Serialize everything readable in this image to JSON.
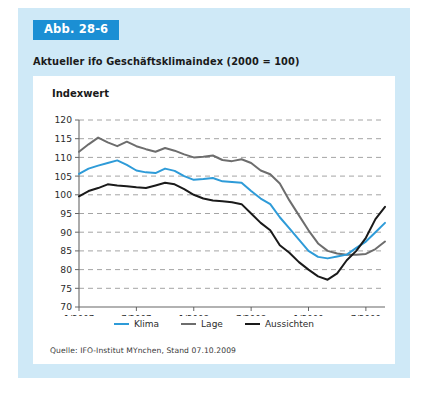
{
  "figure": {
    "badge_label": "Abb. 28-6",
    "title": "Aktueller ifo Geschäftsklimaindex (2000 = 100)",
    "source": "Quelle: IFO-Institut MYnchen, Stand 07.10.2009",
    "panel_color": "#cfe9f7",
    "badge_color": "#1b8fd4",
    "card_color": "#ffffff"
  },
  "chart_data": {
    "type": "line",
    "title": "Aktueller ifo Geschäftsklimaindex (2000 = 100)",
    "xlabel": "",
    "ylabel": "Indexwert",
    "ylim": [
      70,
      120
    ],
    "ytick_values": [
      70,
      75,
      80,
      85,
      90,
      95,
      100,
      105,
      110,
      115,
      120
    ],
    "ytick_labels": [
      "70",
      "75",
      "80",
      "85",
      "90",
      "95",
      "100",
      "105",
      "110",
      "115",
      "120"
    ],
    "xtick_labels": [
      "1/2007",
      "7/2007",
      "1/2008",
      "7/2008",
      "1/2009",
      "7/2009"
    ],
    "xtick_index": [
      0,
      6,
      12,
      18,
      24,
      30
    ],
    "grid": "horizontal-dashed",
    "legend_position": "bottom-center",
    "x": [
      "1/2007",
      "2/2007",
      "3/2007",
      "4/2007",
      "5/2007",
      "6/2007",
      "7/2007",
      "8/2007",
      "9/2007",
      "10/2007",
      "11/2007",
      "12/2007",
      "1/2008",
      "2/2008",
      "3/2008",
      "4/2008",
      "5/2008",
      "6/2008",
      "7/2008",
      "8/2008",
      "9/2008",
      "10/2008",
      "11/2008",
      "12/2008",
      "1/2009",
      "2/2009",
      "3/2009",
      "4/2009",
      "5/2009",
      "6/2009",
      "7/2009",
      "8/2009",
      "9/2009"
    ],
    "series": [
      {
        "name": "Klima",
        "color": "#2e9bd8",
        "values": [
          105.6,
          107.0,
          107.8,
          108.5,
          109.2,
          108.0,
          106.5,
          106.0,
          105.8,
          107.0,
          106.4,
          105.0,
          104.0,
          104.2,
          104.5,
          103.6,
          103.4,
          103.2,
          101.0,
          99.0,
          97.5,
          94.0,
          91.0,
          88.0,
          85.0,
          83.4,
          83.0,
          83.5,
          84.0,
          85.8,
          87.5,
          90.0,
          92.5
        ]
      },
      {
        "name": "Lage",
        "color": "#6d6d6d",
        "values": [
          111.5,
          113.5,
          115.3,
          114.0,
          113.0,
          114.2,
          113.0,
          112.2,
          111.5,
          112.5,
          111.8,
          110.8,
          110.0,
          110.2,
          110.5,
          109.3,
          109.0,
          109.5,
          108.5,
          106.5,
          105.5,
          103.0,
          98.5,
          94.5,
          90.5,
          87.0,
          85.0,
          84.3,
          84.0,
          84.0,
          84.2,
          85.5,
          87.5
        ]
      },
      {
        "name": "Aussichten",
        "color": "#1a1a1a",
        "values": [
          99.6,
          101.0,
          101.8,
          102.8,
          102.5,
          102.3,
          102.0,
          101.8,
          102.5,
          103.2,
          102.8,
          101.5,
          100.0,
          99.0,
          98.5,
          98.3,
          98.0,
          97.5,
          95.0,
          92.5,
          90.5,
          86.5,
          84.5,
          82.0,
          80.0,
          78.2,
          77.3,
          79.0,
          82.5,
          85.0,
          88.5,
          93.5,
          96.8
        ]
      }
    ]
  },
  "legend": {
    "entries": [
      {
        "label": "Klima",
        "color": "#2e9bd8"
      },
      {
        "label": "Lage",
        "color": "#6d6d6d"
      },
      {
        "label": "Aussichten",
        "color": "#1a1a1a"
      }
    ]
  }
}
